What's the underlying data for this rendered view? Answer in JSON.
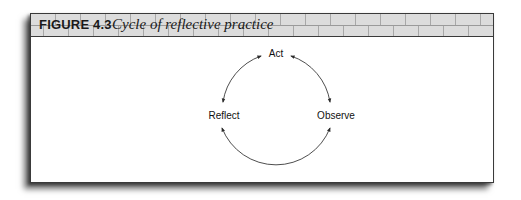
{
  "figure": {
    "number": "FIGURE 4.3",
    "title": "Cycle of reflective practice"
  },
  "diagram": {
    "type": "cycle",
    "nodes": [
      {
        "id": "act",
        "label": "Act",
        "position": "top"
      },
      {
        "id": "observe",
        "label": "Observe",
        "position": "right"
      },
      {
        "id": "reflect",
        "label": "Reflect",
        "position": "left"
      }
    ],
    "edges": [
      {
        "from": "reflect",
        "to": "act",
        "bidirectional": true
      },
      {
        "from": "act",
        "to": "observe",
        "bidirectional": true
      },
      {
        "from": "observe",
        "to": "reflect",
        "bidirectional": true
      }
    ],
    "colors": {
      "line": "#3a3a3a",
      "text": "#111111",
      "header_bg": "#dcdcdc"
    }
  }
}
